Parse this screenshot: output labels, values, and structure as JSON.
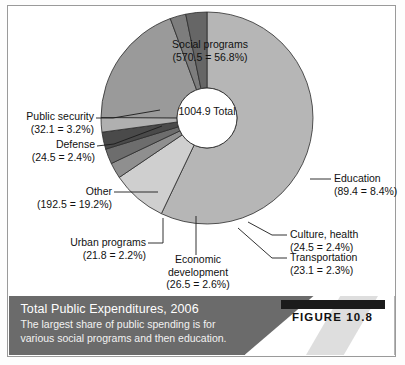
{
  "figure": {
    "badge_label": "FIGURE 10.8",
    "caption_title": "Total Public Expenditures, 2006",
    "caption_line1": "The largest share of public spending is for",
    "caption_line2": "various social programs and then education."
  },
  "center": {
    "total_value": "1004.9",
    "total_label": "Total"
  },
  "chart_data": {
    "type": "pie",
    "title": "Total Public Expenditures, 2006",
    "subtitle": "The largest share of public spending is for various social programs and then education.",
    "total": 1004.9,
    "total_label": "Total",
    "units": "billions",
    "donut": true,
    "legend_position": "callout-labels",
    "categories": [
      "Social programs",
      "Education",
      "Culture, health",
      "Transportation",
      "Economic development",
      "Urban programs",
      "Other",
      "Defense",
      "Public security"
    ],
    "values": [
      570.5,
      89.4,
      24.5,
      23.1,
      26.5,
      21.8,
      192.5,
      24.5,
      32.1
    ],
    "percents": [
      56.8,
      8.4,
      2.4,
      2.3,
      2.6,
      2.2,
      19.2,
      2.4,
      3.2
    ],
    "colors": [
      "#b6b6b6",
      "#cfcfcf",
      "#8f8f8f",
      "#6d6d6d",
      "#4a4a4a",
      "#b0b0b0",
      "#9a9a9a",
      "#7d7d7d",
      "#666666"
    ],
    "slices": [
      {
        "name": "Social programs",
        "value": 570.5,
        "percent": 56.8,
        "color": "#b6b6b6"
      },
      {
        "name": "Education",
        "value": 89.4,
        "percent": 8.4,
        "color": "#cfcfcf"
      },
      {
        "name": "Culture, health",
        "value": 24.5,
        "percent": 2.4,
        "color": "#8f8f8f"
      },
      {
        "name": "Transportation",
        "value": 23.1,
        "percent": 2.3,
        "color": "#6d6d6d"
      },
      {
        "name": "Economic development",
        "value": 26.5,
        "percent": 2.6,
        "color": "#4a4a4a"
      },
      {
        "name": "Urban programs",
        "value": 21.8,
        "percent": 2.2,
        "color": "#b0b0b0"
      },
      {
        "name": "Other",
        "value": 192.5,
        "percent": 19.2,
        "color": "#9a9a9a"
      },
      {
        "name": "Defense",
        "value": 24.5,
        "percent": 2.4,
        "color": "#7d7d7d"
      },
      {
        "name": "Public security",
        "value": 32.1,
        "percent": 3.2,
        "color": "#666666"
      }
    ]
  },
  "labels": {
    "social_programs": {
      "name": "Social programs",
      "amount": "(570.5 = 56.8%)"
    },
    "education": {
      "name": "Education",
      "amount": "(89.4 = 8.4%)"
    },
    "culture_health": {
      "name": "Culture, health",
      "amount": "(24.5 = 2.4%)"
    },
    "transportation": {
      "name": "Transportation",
      "amount": "(23.1 = 2.3%)"
    },
    "economic_development": {
      "name": "Economic",
      "name2": "development",
      "amount": "(26.5 = 2.6%)"
    },
    "urban_programs": {
      "name": "Urban programs",
      "amount": "(21.8 = 2.2%)"
    },
    "other": {
      "name": "Other",
      "amount": "(192.5 = 19.2%)"
    },
    "defense": {
      "name": "Defense",
      "amount": "(24.5 = 2.4%)"
    },
    "public_security": {
      "name": "Public security",
      "amount": "(32.1 = 3.2%)"
    }
  }
}
